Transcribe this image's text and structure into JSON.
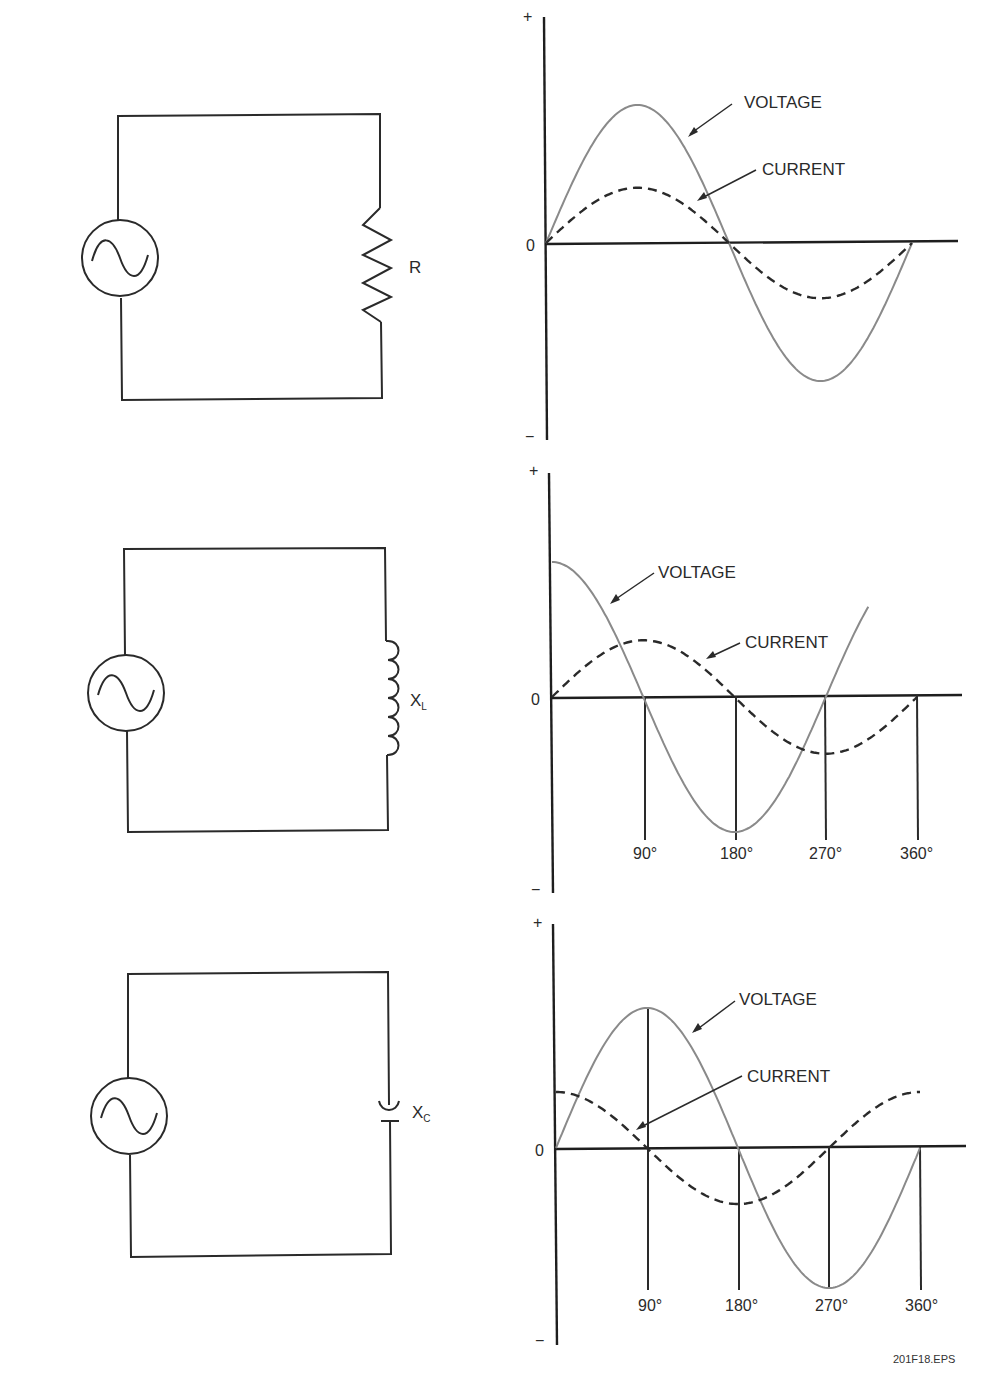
{
  "figure_id": "201F18.EPS",
  "panels": [
    {
      "circuit": {
        "source": "ac-source",
        "component": "resistor",
        "label": "R",
        "label_sub": ""
      },
      "graph": {
        "axis_plus": "+",
        "axis_minus": "−",
        "zero": "0",
        "voltage_label": "VOLTAGE",
        "current_label": "CURRENT",
        "tick_labels": []
      }
    },
    {
      "circuit": {
        "source": "ac-source",
        "component": "inductor",
        "label": "X",
        "label_sub": "L"
      },
      "graph": {
        "axis_plus": "+",
        "axis_minus": "−",
        "zero": "0",
        "voltage_label": "VOLTAGE",
        "current_label": "CURRENT",
        "tick_labels": [
          "90°",
          "180°",
          "270°",
          "360°"
        ]
      }
    },
    {
      "circuit": {
        "source": "ac-source",
        "component": "capacitor",
        "label": "X",
        "label_sub": "C"
      },
      "graph": {
        "axis_plus": "+",
        "axis_minus": "−",
        "zero": "0",
        "voltage_label": "VOLTAGE",
        "current_label": "CURRENT",
        "tick_labels": [
          "90°",
          "180°",
          "270°",
          "360°"
        ]
      }
    }
  ],
  "chart_data": [
    {
      "type": "line",
      "title": "Resistive circuit (R): voltage and current in phase",
      "xlabel": "Phase angle (degrees)",
      "ylabel": "Amplitude (+ / −)",
      "x": [
        0,
        45,
        90,
        135,
        180,
        225,
        270,
        315,
        360
      ],
      "series": [
        {
          "name": "VOLTAGE",
          "style": "solid-gray",
          "values": [
            0,
            0.71,
            1.0,
            0.71,
            0,
            -0.71,
            -1.0,
            -0.71,
            0
          ]
        },
        {
          "name": "CURRENT",
          "style": "dashed-black",
          "values": [
            0,
            0.28,
            0.4,
            0.28,
            0,
            -0.28,
            -0.4,
            -0.28,
            0
          ]
        }
      ],
      "phase_relation": "in phase",
      "grid": false
    },
    {
      "type": "line",
      "title": "Inductive circuit (XL): current lags voltage by 90°",
      "xlabel": "Phase angle (degrees)",
      "ylabel": "Amplitude (+ / −)",
      "x": [
        0,
        45,
        90,
        135,
        180,
        225,
        270,
        315,
        360
      ],
      "tick_labels": [
        "90°",
        "180°",
        "270°",
        "360°"
      ],
      "series": [
        {
          "name": "VOLTAGE",
          "style": "solid-gray",
          "values": [
            1.0,
            0.71,
            0,
            -0.71,
            -1.0,
            -0.71,
            0,
            0.71,
            1.0
          ]
        },
        {
          "name": "CURRENT",
          "style": "dashed-black",
          "values": [
            0,
            0.29,
            0.42,
            0.29,
            0,
            -0.29,
            -0.42,
            -0.29,
            0
          ]
        }
      ],
      "phase_relation": "current lags voltage 90°",
      "grid": false
    },
    {
      "type": "line",
      "title": "Capacitive circuit (XC): current leads voltage by 90°",
      "xlabel": "Phase angle (degrees)",
      "ylabel": "Amplitude (+ / −)",
      "x": [
        0,
        45,
        90,
        135,
        180,
        225,
        270,
        315,
        360
      ],
      "tick_labels": [
        "90°",
        "180°",
        "270°",
        "360°"
      ],
      "series": [
        {
          "name": "VOLTAGE",
          "style": "solid-gray",
          "values": [
            0,
            0.71,
            1.0,
            0.71,
            0,
            -0.71,
            -1.0,
            -0.71,
            0
          ]
        },
        {
          "name": "CURRENT",
          "style": "dashed-black",
          "values": [
            0.4,
            0.28,
            0,
            -0.28,
            -0.4,
            -0.28,
            0,
            0.28,
            0.4
          ]
        }
      ],
      "phase_relation": "current leads voltage 90°",
      "grid": false
    }
  ]
}
